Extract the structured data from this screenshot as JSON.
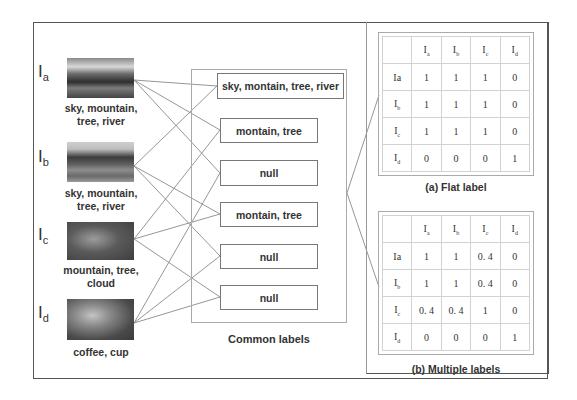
{
  "images": [
    {
      "id": "a",
      "label": "I",
      "sub": "a",
      "caption_lines": [
        "sky, mountain,",
        "tree, river"
      ]
    },
    {
      "id": "b",
      "label": "I",
      "sub": "b",
      "caption_lines": [
        "sky, mountain,",
        "tree, river"
      ]
    },
    {
      "id": "c",
      "label": "I",
      "sub": "c",
      "caption_lines": [
        "mountain, tree,",
        "cloud"
      ]
    },
    {
      "id": "d",
      "label": "I",
      "sub": "d",
      "caption_lines": [
        "coffee, cup"
      ]
    }
  ],
  "common_labels": {
    "title": "Common labels",
    "boxes": [
      {
        "text": "sky, montain, tree, river",
        "pair": [
          "a",
          "b"
        ]
      },
      {
        "text": "montain, tree",
        "pair": [
          "a",
          "c"
        ]
      },
      {
        "text": "null",
        "pair": [
          "a",
          "d"
        ]
      },
      {
        "text": "montain, tree",
        "pair": [
          "b",
          "c"
        ]
      },
      {
        "text": "null",
        "pair": [
          "b",
          "d"
        ]
      },
      {
        "text": "null",
        "pair": [
          "c",
          "d"
        ]
      }
    ]
  },
  "matrices": [
    {
      "caption": "(a) Flat label",
      "col_headers": [
        "",
        "a",
        "b",
        "c",
        "d"
      ],
      "row_headers": [
        "Ia",
        "b",
        "c",
        "d"
      ],
      "rows": [
        [
          "1",
          "1",
          "1",
          "0"
        ],
        [
          "1",
          "1",
          "1",
          "0"
        ],
        [
          "1",
          "1",
          "1",
          "0"
        ],
        [
          "0",
          "0",
          "0",
          "1"
        ]
      ]
    },
    {
      "caption": "(b) Multiple labels",
      "col_headers": [
        "",
        "a",
        "b",
        "c",
        "d"
      ],
      "row_headers": [
        "Ia",
        "b",
        "c",
        "d"
      ],
      "rows": [
        [
          "1",
          "1",
          "0. 4",
          "0"
        ],
        [
          "1",
          "1",
          "0. 4",
          "0"
        ],
        [
          "0. 4",
          "0. 4",
          "1",
          "0"
        ],
        [
          "0",
          "0",
          "0",
          "1"
        ]
      ]
    }
  ],
  "colors": {
    "frame": "#555555",
    "lines": "#8a8a8a",
    "text": "#333333"
  }
}
